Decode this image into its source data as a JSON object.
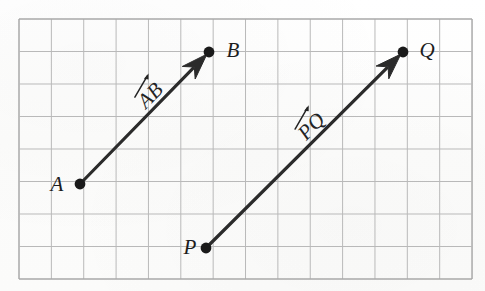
{
  "figure": {
    "kind": "vector-diagram",
    "background_color": "#fdfdfc",
    "ink_color": "#1d1d1d"
  },
  "grid": {
    "line_color": "#b9b9b9",
    "border_color": "#a9a9a9",
    "left": 19,
    "top": 19,
    "right": 472,
    "bottom": 279,
    "columns": 14,
    "rows": 8,
    "cell_width": 32.36,
    "cell_height": 32.5
  },
  "points": [
    {
      "id": "A",
      "label": "A",
      "x": 80,
      "y": 184,
      "label_x": 57,
      "label_y": 184,
      "dot_radius": 5.4
    },
    {
      "id": "B",
      "label": "B",
      "x": 209,
      "y": 52,
      "label_x": 233,
      "label_y": 50,
      "dot_radius": 5.4
    },
    {
      "id": "P",
      "label": "P",
      "x": 206,
      "y": 248,
      "label_x": 190,
      "label_y": 247,
      "dot_radius": 5.4
    },
    {
      "id": "Q",
      "label": "Q",
      "x": 403,
      "y": 52,
      "label_x": 427,
      "label_y": 50,
      "dot_radius": 5.4
    }
  ],
  "vectors": [
    {
      "id": "AB",
      "label": "AB",
      "from": "A",
      "to": "B",
      "x1": 80,
      "y1": 184,
      "x2": 209,
      "y2": 52,
      "stroke_width": 3.2,
      "color": "#2b2b2b",
      "arrowhead_length": 26,
      "arrowhead_half_width": 9,
      "label_x": 148,
      "label_y": 93,
      "label_rotation": -46,
      "label_font_size": 21
    },
    {
      "id": "PQ",
      "label": "PQ",
      "from": "P",
      "to": "Q",
      "x1": 206,
      "y1": 248,
      "x2": 403,
      "y2": 52,
      "stroke_width": 3.2,
      "color": "#2b2b2b",
      "arrowhead_length": 26,
      "arrowhead_half_width": 9,
      "label_x": 309,
      "label_y": 124,
      "label_rotation": -46,
      "label_font_size": 21
    }
  ],
  "point_label_font_size": 21
}
